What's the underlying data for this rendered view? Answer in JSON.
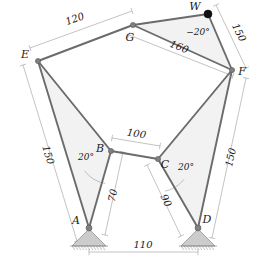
{
  "figure": {
    "type": "mechanism-truss-diagram",
    "width": 263,
    "height": 268,
    "background": "#ffffff"
  },
  "colors": {
    "member": "#6b6b6b",
    "member_dark": "#555555",
    "fill": "#f0f0f0",
    "node": "#808080",
    "node_solid": "#111111",
    "dimension": "#9a9a9a",
    "support": "#cccccc",
    "support_edge": "#888888",
    "text": "#1a1a1a"
  },
  "nodes": [
    {
      "id": "A",
      "label": "A",
      "x": 89,
      "y": 228,
      "kind": "pin-support",
      "label_dx": -13,
      "label_dy": -4
    },
    {
      "id": "B",
      "label": "B",
      "x": 111,
      "y": 151,
      "kind": "joint",
      "label_dx": -11,
      "label_dy": 1
    },
    {
      "id": "C",
      "label": "C",
      "x": 158,
      "y": 159,
      "kind": "joint",
      "label_dx": 7,
      "label_dy": 9
    },
    {
      "id": "D",
      "label": "D",
      "x": 198,
      "y": 228,
      "kind": "pin-support",
      "label_dx": 9,
      "label_dy": -5
    },
    {
      "id": "E",
      "label": "E",
      "x": 38,
      "y": 61,
      "kind": "joint",
      "label_dx": -13,
      "label_dy": -3
    },
    {
      "id": "F",
      "label": "F",
      "x": 232,
      "y": 70,
      "kind": "joint",
      "label_dx": 10,
      "label_dy": 5
    },
    {
      "id": "G",
      "label": "G",
      "x": 133,
      "y": 25,
      "kind": "joint",
      "label_dx": -3,
      "label_dy": 16
    },
    {
      "id": "W",
      "label": "W",
      "x": 208,
      "y": 14,
      "kind": "solid-node",
      "label_dx": -13,
      "label_dy": -4
    }
  ],
  "members": [
    {
      "from": "E",
      "to": "G"
    },
    {
      "from": "G",
      "to": "W"
    },
    {
      "from": "W",
      "to": "F"
    },
    {
      "from": "G",
      "to": "F"
    },
    {
      "from": "E",
      "to": "A"
    },
    {
      "from": "E",
      "to": "B"
    },
    {
      "from": "A",
      "to": "B"
    },
    {
      "from": "B",
      "to": "C"
    },
    {
      "from": "C",
      "to": "D"
    },
    {
      "from": "C",
      "to": "F"
    },
    {
      "from": "D",
      "to": "F"
    }
  ],
  "panels": [
    {
      "name": "panel-E-A-B",
      "points": "38,61 89,228 111,151"
    },
    {
      "name": "panel-C-D-F",
      "points": "158,159 198,228 232,70"
    },
    {
      "name": "panel-G-W-F",
      "points": "133,25 208,14 232,70"
    }
  ],
  "dimensions": [
    {
      "id": "dim-EG",
      "value": "120",
      "x1": 30,
      "y1": 48,
      "x2": 132,
      "y2": 11,
      "lx": 76,
      "ly": 22,
      "rot": -20
    },
    {
      "id": "dim-WF",
      "value": "150",
      "x1": 216,
      "y1": 5,
      "x2": 246,
      "y2": 68,
      "lx": 236,
      "ly": 34,
      "rot": 64
    },
    {
      "id": "dim-GF",
      "value": "160",
      "x1": 129,
      "y1": 35,
      "x2": 233,
      "y2": 76,
      "lx": 178,
      "ly": 50,
      "rot": 21
    },
    {
      "id": "dim-EA",
      "value": "150",
      "x1": 23,
      "y1": 65,
      "x2": 77,
      "y2": 241,
      "lx": 45,
      "ly": 156,
      "rot": 73
    },
    {
      "id": "dim-DF",
      "value": "150",
      "x1": 246,
      "y1": 78,
      "x2": 212,
      "y2": 238,
      "lx": 234,
      "ly": 158,
      "rot": -78
    },
    {
      "id": "dim-BC",
      "value": "100",
      "x1": 112,
      "y1": 138,
      "x2": 160,
      "y2": 146,
      "lx": 136,
      "ly": 137,
      "rot": 9
    },
    {
      "id": "dim-AB",
      "value": "70",
      "x1": 123,
      "y1": 152,
      "x2": 105,
      "y2": 235,
      "lx": 116,
      "ly": 196,
      "rot": -78
    },
    {
      "id": "dim-CD",
      "value": "90",
      "x1": 147,
      "y1": 165,
      "x2": 181,
      "y2": 236,
      "lx": 163,
      "ly": 202,
      "rot": 64
    },
    {
      "id": "dim-AD",
      "value": "110",
      "x1": 89,
      "y1": 252,
      "x2": 198,
      "y2": 252,
      "lx": 143,
      "ly": 248,
      "rot": 0
    }
  ],
  "angles": [
    {
      "id": "angle-B",
      "value": "20°",
      "lx": 86,
      "ly": 160,
      "cx": 111,
      "cy": 151,
      "r": 33,
      "a1": 100,
      "a2": 143
    },
    {
      "id": "angle-C",
      "value": "20°",
      "lx": 186,
      "ly": 170,
      "cx": 158,
      "cy": 159,
      "r": 33,
      "a1": 38,
      "a2": 78
    },
    {
      "id": "angle-W",
      "value": "−20°",
      "lx": 198,
      "ly": 35,
      "cx": 208,
      "cy": 14,
      "r": 0,
      "a1": 0,
      "a2": 0
    }
  ],
  "supports": [
    {
      "id": "support-A",
      "node": "A",
      "x": 89,
      "y": 228,
      "half_width": 17,
      "height": 18
    },
    {
      "id": "support-D",
      "node": "D",
      "x": 198,
      "y": 228,
      "half_width": 17,
      "height": 18
    }
  ]
}
